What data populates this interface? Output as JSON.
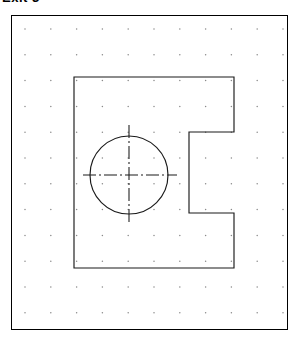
{
  "page": {
    "title": "Exit 3",
    "background_color": "#ffffff"
  },
  "canvas": {
    "name": "drafting-canvas",
    "border_color": "#000000",
    "width": 277,
    "height": 315,
    "background_color": "#ffffff"
  },
  "grid": {
    "name": "snap-dot-grid",
    "dot_color": "#8a8a8a",
    "spacing": 25.8,
    "origin_x": 13,
    "origin_y": 13,
    "columns": 11,
    "rows": 12,
    "dot_radius": 0.75
  },
  "chart_data": {
    "type": "technical-drawing",
    "title": "Exit 3",
    "units": "grid",
    "stroke_color": "#1a1a1a",
    "shapes": [
      {
        "name": "part-outline",
        "kind": "polygon",
        "closed": true,
        "points": [
          [
            62,
            61
          ],
          [
            222,
            61
          ],
          [
            222,
            116
          ],
          [
            177,
            116
          ],
          [
            177,
            197
          ],
          [
            222,
            197
          ],
          [
            222,
            252
          ],
          [
            62,
            252
          ]
        ]
      },
      {
        "name": "hole-circle",
        "kind": "circle",
        "cx": 117,
        "cy": 159,
        "r": 39
      },
      {
        "name": "horizontal-centerline",
        "kind": "line",
        "x1": 71,
        "y1": 159,
        "x2": 165,
        "y2": 159
      },
      {
        "name": "vertical-centerline",
        "kind": "line",
        "x1": 117,
        "y1": 109,
        "x2": 117,
        "y2": 209
      }
    ]
  }
}
